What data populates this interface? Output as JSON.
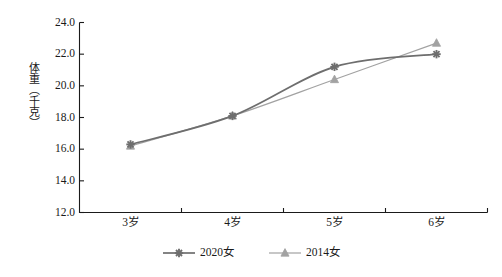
{
  "chart_data": {
    "type": "line",
    "title": "",
    "xlabel": "",
    "ylabel": "体重（千克）",
    "categories": [
      "3岁",
      "4岁",
      "5岁",
      "6岁"
    ],
    "ylim": [
      12.0,
      24.0
    ],
    "ytick_step": 2.0,
    "yticks": [
      "24.0",
      "22.0",
      "20.0",
      "18.0",
      "16.0",
      "14.0",
      "12.0"
    ],
    "ytick_values": [
      24.0,
      22.0,
      20.0,
      18.0,
      16.0,
      14.0,
      12.0
    ],
    "grid": false,
    "legend_position": "bottom",
    "series": [
      {
        "name": "2020女",
        "marker": "star",
        "color": "#6e6e6e",
        "values": [
          16.3,
          18.1,
          21.2,
          22.0
        ]
      },
      {
        "name": "2014女",
        "marker": "triangle",
        "color": "#a2a2a2",
        "values": [
          16.2,
          18.1,
          20.4,
          22.7
        ]
      }
    ]
  },
  "axes": {
    "y_title": "体重（千克）",
    "y_tick_labels": [
      "24.0",
      "22.0",
      "20.0",
      "18.0",
      "16.0",
      "14.0",
      "12.0"
    ],
    "x_tick_labels": [
      "3岁",
      "4岁",
      "5岁",
      "6岁"
    ]
  },
  "legend": {
    "items": [
      {
        "label": "2020女",
        "color": "#6e6e6e",
        "marker": "star"
      },
      {
        "label": "2014女",
        "color": "#a2a2a2",
        "marker": "triangle"
      }
    ]
  },
  "colors": {
    "axis": "#1a1a1a",
    "series_2020": "#6e6e6e",
    "series_2014": "#a2a2a2",
    "background": "#ffffff"
  }
}
